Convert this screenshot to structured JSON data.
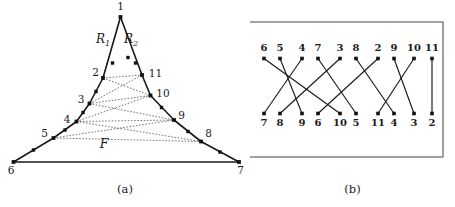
{
  "figure": {
    "panels": [
      {
        "caption": "(a)",
        "name": "polygon-diagram"
      },
      {
        "caption": "(b)",
        "name": "permutation-diagram"
      }
    ]
  },
  "panel_a": {
    "region_labels": [
      {
        "id": "R1",
        "text": "R",
        "sub": "1",
        "x": 103,
        "y": 43
      },
      {
        "id": "R2",
        "text": "R",
        "sub": "2",
        "x": 131,
        "y": 43
      }
    ],
    "face_label": {
      "text": "F",
      "x": 104,
      "y": 148
    },
    "vertices": [
      {
        "id": "1",
        "x": 120.5,
        "y": 17.0,
        "label": "1",
        "lx": 120.5,
        "ly": 10.0,
        "anchor": "middle"
      },
      {
        "id": "2",
        "x": 103.0,
        "y": 78.0,
        "label": "2",
        "lx": 95.5,
        "ly": 76.0,
        "anchor": "middle"
      },
      {
        "id": "3",
        "x": 89.5,
        "y": 103.5,
        "label": "3",
        "lx": 81.0,
        "ly": 103.0,
        "anchor": "middle"
      },
      {
        "id": "4",
        "x": 76.5,
        "y": 121.5,
        "label": "4",
        "lx": 67.0,
        "ly": 122.5,
        "anchor": "middle"
      },
      {
        "id": "5",
        "x": 53.5,
        "y": 138.0,
        "label": "5",
        "lx": 44.5,
        "ly": 137.0,
        "anchor": "middle"
      },
      {
        "id": "6",
        "x": 13.5,
        "y": 162.0,
        "label": "6",
        "lx": 11.0,
        "ly": 174.0,
        "anchor": "middle"
      },
      {
        "id": "7",
        "x": 239.0,
        "y": 162.0,
        "label": "7",
        "lx": 240.5,
        "ly": 174.0,
        "anchor": "middle"
      },
      {
        "id": "8",
        "x": 201.0,
        "y": 141.5,
        "label": "8",
        "lx": 208.5,
        "ly": 136.5,
        "anchor": "middle"
      },
      {
        "id": "9",
        "x": 174.0,
        "y": 120.0,
        "label": "9",
        "lx": 181.5,
        "ly": 119.0,
        "anchor": "middle"
      },
      {
        "id": "10",
        "x": 150.5,
        "y": 95.5,
        "label": "10",
        "lx": 163.0,
        "ly": 96.5,
        "anchor": "middle"
      },
      {
        "id": "11",
        "x": 142.0,
        "y": 75.0,
        "label": "11",
        "lx": 155.5,
        "ly": 76.5,
        "anchor": "middle"
      }
    ],
    "extra_nodes": [
      {
        "x": 128.0,
        "y": 57.5
      },
      {
        "x": 135.5,
        "y": 63.0
      },
      {
        "x": 112.5,
        "y": 63.0
      },
      {
        "x": 96.0,
        "y": 91.5
      },
      {
        "x": 83.0,
        "y": 112.5
      },
      {
        "x": 65.0,
        "y": 130.0
      },
      {
        "x": 161.5,
        "y": 107.5
      },
      {
        "x": 188.0,
        "y": 131.5
      },
      {
        "x": 220.0,
        "y": 152.0
      },
      {
        "x": 33.5,
        "y": 150.0
      }
    ],
    "solid_path_left": "120.5,17 103,78 89.5,103.5 76.5,121.5 53.5,138 13.5,162",
    "solid_path_right": "120.5,17 142,75 150.5,95.5 174,120 201,141.5 239,162",
    "solid_base": "13.5,162 239,162",
    "dashed_edges": [
      {
        "from": "2",
        "to": "11"
      },
      {
        "from": "2",
        "to": "10"
      },
      {
        "from": "3",
        "to": "11"
      },
      {
        "from": "3",
        "to": "10"
      },
      {
        "from": "3",
        "to": "9"
      },
      {
        "from": "4",
        "to": "10"
      },
      {
        "from": "4",
        "to": "9"
      },
      {
        "from": "4",
        "to": "8"
      },
      {
        "from": "5",
        "to": "9"
      },
      {
        "from": "5",
        "to": "8"
      },
      {
        "from": "1",
        "to": "2"
      }
    ]
  },
  "panel_b": {
    "frame": {
      "x": 248,
      "y": 22,
      "width": 195,
      "height": 135
    },
    "top_row": {
      "labels": [
        "6",
        "5",
        "4",
        "7",
        "3",
        "8",
        "2",
        "9",
        "10",
        "11"
      ],
      "y_dot": 58.5,
      "y_label": 50.5,
      "xs": [
        264,
        280,
        302,
        318,
        340,
        356,
        378,
        394,
        414,
        432
      ]
    },
    "bottom_row": {
      "labels": [
        "7",
        "8",
        "9",
        "6",
        "10",
        "5",
        "11",
        "4",
        "3",
        "2"
      ],
      "y_dot": 113.5,
      "y_label": 126.0,
      "xs": [
        264,
        280,
        302,
        318,
        340,
        356,
        378,
        394,
        414,
        432
      ]
    },
    "edges": [
      {
        "top_index": 0,
        "bottom_index": 4
      },
      {
        "top_index": 1,
        "bottom_index": 2
      },
      {
        "top_index": 2,
        "bottom_index": 0
      },
      {
        "top_index": 3,
        "bottom_index": 5
      },
      {
        "top_index": 4,
        "bottom_index": 1
      },
      {
        "top_index": 5,
        "bottom_index": 7
      },
      {
        "top_index": 6,
        "bottom_index": 3
      },
      {
        "top_index": 7,
        "bottom_index": 8
      },
      {
        "top_index": 8,
        "bottom_index": 6
      },
      {
        "top_index": 9,
        "bottom_index": 9
      }
    ]
  }
}
